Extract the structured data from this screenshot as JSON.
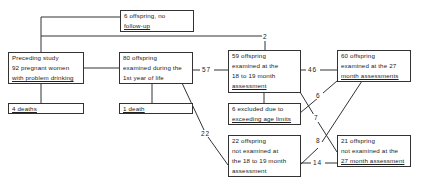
{
  "diagram": {
    "type": "flowchart",
    "boxes": {
      "no_followup": {
        "lines": [
          "6 offspring, no",
          "follow-up"
        ]
      },
      "preceding": {
        "lines": [
          "Preceding study",
          "92 pregnant women",
          "with problem drinking"
        ]
      },
      "deaths4": {
        "lines": [
          "4 deaths"
        ]
      },
      "examined80": {
        "lines": [
          "80 offspring",
          "examined during the",
          "1st year of life"
        ]
      },
      "death1": {
        "lines": [
          "1 death"
        ]
      },
      "examined59": {
        "lines": [
          "59 offspring",
          "examined at the",
          "18 to 19 month",
          "assessment"
        ]
      },
      "excluded6": {
        "lines": [
          "6 excluded due to",
          "exceeding age limits"
        ]
      },
      "notexamined22": {
        "lines": [
          "22 offspring",
          "not examined at",
          "the 18 to 19 month",
          "assessment"
        ]
      },
      "examined60": {
        "lines": [
          "60 offspring",
          "examined at the 27",
          "month assessments"
        ]
      },
      "notexamined21": {
        "lines": [
          "21 offspring",
          "not examined at the",
          "27 month assessment"
        ]
      }
    },
    "edge_labels": {
      "top_line": "2",
      "to59": "57",
      "to22": "22",
      "to60": "46",
      "excl_to60": "6",
      "to21_from59": "7",
      "from22_to60": "8",
      "from22_to21": "14"
    },
    "colors": {
      "line": "#333333",
      "text": "#222222",
      "background": "#ffffff"
    }
  }
}
